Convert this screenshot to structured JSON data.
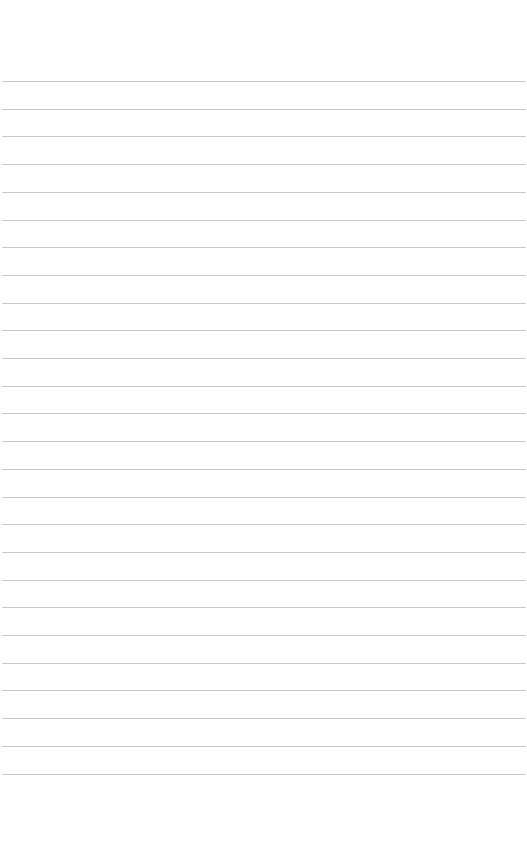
{
  "page": {
    "type": "ruled-paper",
    "background": "#ffffff",
    "line_color": "#c9c9c9",
    "line_count": 26,
    "first_line_y": 81,
    "line_spacing": 27.7,
    "text": ""
  }
}
